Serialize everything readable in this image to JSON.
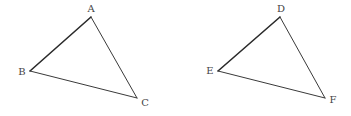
{
  "diagram": {
    "type": "geometry",
    "triangles": [
      {
        "name": "ABC",
        "vertices": {
          "A": {
            "label": "A",
            "x": 91,
            "y": 17,
            "lx": 91,
            "ly": 12
          },
          "B": {
            "label": "B",
            "x": 30,
            "y": 71,
            "lx": 22,
            "ly": 75
          },
          "C": {
            "label": "C",
            "x": 137,
            "y": 98,
            "lx": 145,
            "ly": 106
          }
        }
      },
      {
        "name": "DEF",
        "vertices": {
          "D": {
            "label": "D",
            "x": 280,
            "y": 17,
            "lx": 281,
            "ly": 12
          },
          "E": {
            "label": "E",
            "x": 218,
            "y": 71,
            "lx": 210,
            "ly": 74
          },
          "F": {
            "label": "F",
            "x": 325,
            "y": 98,
            "lx": 333,
            "ly": 103
          }
        }
      }
    ],
    "labels": {
      "A": "A",
      "B": "B",
      "C": "C",
      "D": "D",
      "E": "E",
      "F": "F"
    },
    "colors": {
      "line": "#3a3a3a",
      "label": "#444444",
      "background": "#ffffff"
    }
  }
}
